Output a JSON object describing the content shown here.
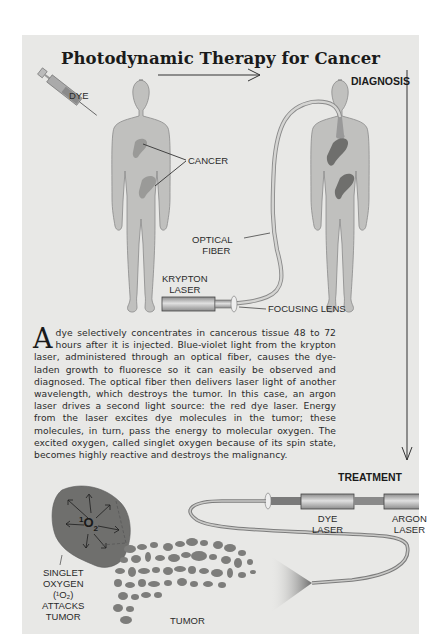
{
  "title": "Photodynamic Therapy for Cancer",
  "stages": {
    "diagnosis": "DIAGNOSIS",
    "treatment": "TREATMENT"
  },
  "labels": {
    "dye": "DYE",
    "cancer": "CANCER",
    "optical_fiber_1": "OPTICAL",
    "optical_fiber_2": "FIBER",
    "krypton_laser_1": "KRYPTON",
    "krypton_laser_2": "LASER",
    "focusing_lens": "FOCUSING LENS",
    "dye_laser_1": "DYE",
    "dye_laser_2": "LASER",
    "argon_laser_1": "ARGON",
    "argon_laser_2": "LASER",
    "singlet_1": "SINGLET",
    "singlet_2": "OXYGEN",
    "singlet_3": "(¹O₂)",
    "singlet_4": "ATTACKS",
    "singlet_5": "TUMOR",
    "tumor": "TUMOR",
    "o2_sup": "1",
    "o2_main": "O",
    "o2_sub": "2"
  },
  "paragraph": {
    "dropcap": "A",
    "text": "dye selectively concentrates in cancerous tissue 48 to 72 hours after it is injected. Blue-violet light from the krypton laser, administered through an optical fiber, causes the dye-laden growth to fluoresce so it can easily be observed and diagnosed. The optical fiber then delivers laser light of another wavelength, which destroys the tumor. In this case, an argon laser drives a second light source: the red dye laser. Energy from the laser excites dye molecules in the tumor; these molecules, in turn, pass the energy to molecular oxygen. The excited oxygen, called singlet oxygen because of its spin state, becomes highly reactive and destroys the malignancy."
  },
  "colors": {
    "background": "#e8e8e6",
    "body": "#bfbfbd",
    "tumor": "#7a7a7a",
    "text": "#2a2a2a"
  }
}
